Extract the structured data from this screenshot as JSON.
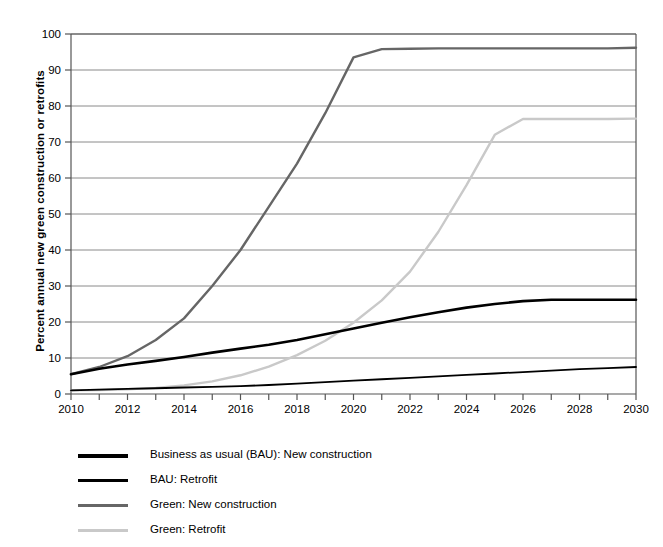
{
  "chart_data": {
    "type": "line",
    "title": "",
    "xlabel": "",
    "ylabel": "Percent annual new green construction or retrofits",
    "xlim": [
      2010,
      2030
    ],
    "ylim": [
      0,
      100
    ],
    "grid": true,
    "legend_position": "below-left",
    "y_ticks": [
      0,
      10,
      20,
      30,
      40,
      50,
      60,
      70,
      80,
      90,
      100
    ],
    "y_tick_labels": [
      "0",
      "10",
      "20",
      "30",
      "40",
      "50",
      "60",
      "70",
      "80",
      "90",
      "100"
    ],
    "x_ticks": [
      2010,
      2012,
      2014,
      2016,
      2018,
      2020,
      2022,
      2024,
      2026,
      2028,
      2030
    ],
    "x_tick_labels": [
      "2010",
      "2012",
      "2014",
      "2016",
      "2018",
      "2020",
      "2022",
      "2024",
      "2026",
      "2028",
      "2030"
    ],
    "x_minor_tick_interval": 1,
    "x": [
      2010,
      2011,
      2012,
      2013,
      2014,
      2015,
      2016,
      2017,
      2018,
      2019,
      2020,
      2021,
      2022,
      2023,
      2024,
      2025,
      2026,
      2027,
      2028,
      2029,
      2030
    ],
    "series": [
      {
        "name": "Business as usual (BAU): New construction",
        "color": "#000000",
        "width": 2.6,
        "values": [
          5.5,
          7.0,
          8.2,
          9.2,
          10.3,
          11.5,
          12.6,
          13.7,
          15.0,
          16.6,
          18.2,
          19.8,
          21.3,
          22.7,
          24.0,
          25.0,
          25.8,
          26.2,
          26.2,
          26.2,
          26.2
        ]
      },
      {
        "name": "BAU: Retrofit",
        "color": "#000000",
        "width": 1.8,
        "values": [
          1.0,
          1.2,
          1.4,
          1.6,
          1.8,
          2.0,
          2.2,
          2.5,
          2.9,
          3.3,
          3.7,
          4.1,
          4.5,
          4.9,
          5.3,
          5.7,
          6.1,
          6.5,
          6.9,
          7.2,
          7.5
        ]
      },
      {
        "name": "Green: New construction",
        "color": "#666666",
        "width": 2.4,
        "values": [
          5.5,
          7.5,
          10.5,
          15.0,
          21.0,
          30.0,
          40.0,
          52.0,
          64.0,
          78.0,
          93.5,
          95.8,
          95.9,
          96.0,
          96.0,
          96.0,
          96.0,
          96.0,
          96.0,
          96.0,
          96.2
        ]
      },
      {
        "name": "Green: Retrofit",
        "color": "#c9c9c9",
        "width": 2.4,
        "values": [
          1.0,
          1.1,
          1.3,
          1.7,
          2.4,
          3.5,
          5.2,
          7.6,
          10.8,
          14.8,
          19.8,
          26.0,
          34.0,
          45.0,
          58.0,
          72.0,
          76.4,
          76.4,
          76.4,
          76.4,
          76.5
        ]
      }
    ]
  },
  "legend": {
    "items": [
      {
        "label": "Business as usual (BAU): New construction",
        "color": "#000000",
        "thickness": 4
      },
      {
        "label": "BAU: Retrofit",
        "color": "#000000",
        "thickness": 3
      },
      {
        "label": "Green: New construction",
        "color": "#666666",
        "thickness": 3
      },
      {
        "label": "Green: Retrofit",
        "color": "#c9c9c9",
        "thickness": 3
      }
    ]
  },
  "axes": {
    "axis_color": "#555555",
    "grid_color": "#8a8a8a",
    "background": "#ffffff"
  }
}
